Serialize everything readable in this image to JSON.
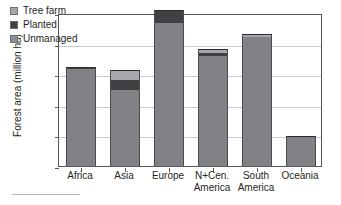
{
  "chart_data": {
    "type": "bar",
    "stacked": true,
    "title": "",
    "xlabel": "",
    "ylabel": "Forest area (million ha)",
    "ylim": [
      0,
      1000
    ],
    "ytick_values": [
      0,
      200,
      400,
      600,
      800,
      1000
    ],
    "ytick_labels": [
      "0",
      "200",
      "400",
      "600",
      "800",
      "1000"
    ],
    "grid": true,
    "legend_position": "top-left",
    "categories": [
      "Africa",
      "Asia",
      "Europe",
      "N+Cen. America",
      "South America",
      "Oceania"
    ],
    "category_lines": [
      [
        "Africa"
      ],
      [
        "Asia"
      ],
      [
        "Europe"
      ],
      [
        "N+Cen.",
        "America"
      ],
      [
        "South",
        "America"
      ],
      [
        "Oceania"
      ]
    ],
    "series": [
      {
        "name": "Unmanaged",
        "color": "#818285",
        "values": [
          635,
          495,
          935,
          720,
          840,
          195
        ]
      },
      {
        "name": "Planted",
        "color": "#414042",
        "values": [
          10,
          65,
          75,
          20,
          5,
          0
        ]
      },
      {
        "name": "Tree farm",
        "color": "#a6a8ab",
        "values": [
          0,
          70,
          5,
          25,
          15,
          0
        ]
      }
    ],
    "totals": [
      645,
      630,
      1015,
      765,
      860,
      195
    ]
  },
  "legend": {
    "items": [
      {
        "label": "Tree farm",
        "swatch": "treefarm"
      },
      {
        "label": "Planted",
        "swatch": "planted"
      },
      {
        "label": "Unmanaged",
        "swatch": "unmanaged"
      }
    ]
  },
  "colors": {
    "unmanaged": "#818285",
    "planted": "#414042",
    "treefarm": "#a6a8ab",
    "axis": "#58595b",
    "grid": "#c9cacc",
    "text": "#231f20",
    "background": "#ffffff"
  }
}
